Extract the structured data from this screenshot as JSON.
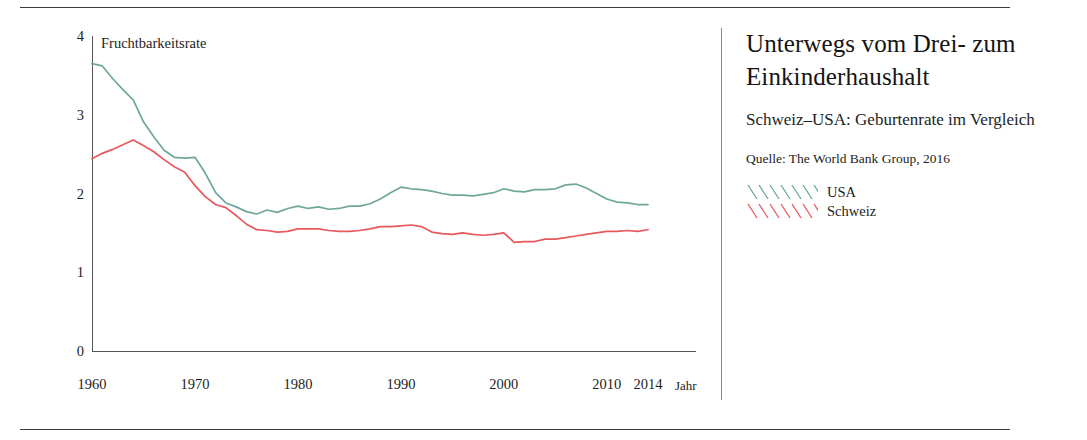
{
  "rules": {
    "top": "horizontal-rule",
    "bottom": "horizontal-rule"
  },
  "text_panel": {
    "headline": "Unterwegs vom Drei- zum Einkinderhaushalt",
    "subhead": "Schweiz–USA: Geburtenrate im Vergleich",
    "source": "Quelle: The World Bank Group, 2016",
    "legend": [
      {
        "label": "USA",
        "color": "#6fa79b"
      },
      {
        "label": "Schweiz",
        "color": "#e8585c"
      }
    ]
  },
  "chart_data": {
    "type": "line",
    "title": "Fruchtbarkeitsrate",
    "xlabel": "Jahr",
    "ylabel": "Fruchtbarkeitsrate",
    "xlim": [
      1960,
      2014
    ],
    "ylim": [
      0,
      4
    ],
    "yticks": [
      "0",
      "1",
      "2",
      "3",
      "4"
    ],
    "ytick_values": [
      0,
      1,
      2,
      3,
      4
    ],
    "xticks": [
      "1960",
      "1970",
      "1980",
      "1990",
      "2000",
      "2010",
      "2014"
    ],
    "xtick_values": [
      1960,
      1970,
      1980,
      1990,
      2000,
      2010,
      2014
    ],
    "grid": false,
    "legend_position": "right-panel",
    "x": [
      1960,
      1961,
      1962,
      1963,
      1964,
      1965,
      1966,
      1967,
      1968,
      1969,
      1970,
      1971,
      1972,
      1973,
      1974,
      1975,
      1976,
      1977,
      1978,
      1979,
      1980,
      1981,
      1982,
      1983,
      1984,
      1985,
      1986,
      1987,
      1988,
      1989,
      1990,
      1991,
      1992,
      1993,
      1994,
      1995,
      1996,
      1997,
      1998,
      1999,
      2000,
      2001,
      2002,
      2003,
      2004,
      2005,
      2006,
      2007,
      2008,
      2009,
      2010,
      2011,
      2012,
      2013,
      2014
    ],
    "series": [
      {
        "name": "USA",
        "color": "#6fa79b",
        "values": [
          3.65,
          3.62,
          3.46,
          3.32,
          3.19,
          2.91,
          2.72,
          2.55,
          2.46,
          2.45,
          2.46,
          2.26,
          2.01,
          1.88,
          1.83,
          1.77,
          1.74,
          1.79,
          1.76,
          1.81,
          1.84,
          1.81,
          1.83,
          1.8,
          1.81,
          1.84,
          1.84,
          1.87,
          1.93,
          2.01,
          2.08,
          2.06,
          2.05,
          2.03,
          2.0,
          1.98,
          1.98,
          1.97,
          1.99,
          2.01,
          2.06,
          2.03,
          2.02,
          2.05,
          2.05,
          2.06,
          2.11,
          2.12,
          2.07,
          2.0,
          1.93,
          1.89,
          1.88,
          1.86,
          1.86
        ]
      },
      {
        "name": "Schweiz",
        "color": "#e8585c",
        "values": [
          2.44,
          2.51,
          2.56,
          2.62,
          2.68,
          2.61,
          2.53,
          2.43,
          2.34,
          2.27,
          2.1,
          1.96,
          1.86,
          1.82,
          1.72,
          1.61,
          1.54,
          1.53,
          1.51,
          1.52,
          1.55,
          1.55,
          1.55,
          1.53,
          1.52,
          1.52,
          1.53,
          1.55,
          1.58,
          1.58,
          1.59,
          1.6,
          1.58,
          1.51,
          1.49,
          1.48,
          1.5,
          1.48,
          1.47,
          1.48,
          1.5,
          1.38,
          1.39,
          1.39,
          1.42,
          1.42,
          1.44,
          1.46,
          1.48,
          1.5,
          1.52,
          1.52,
          1.53,
          1.52,
          1.54
        ]
      }
    ]
  }
}
